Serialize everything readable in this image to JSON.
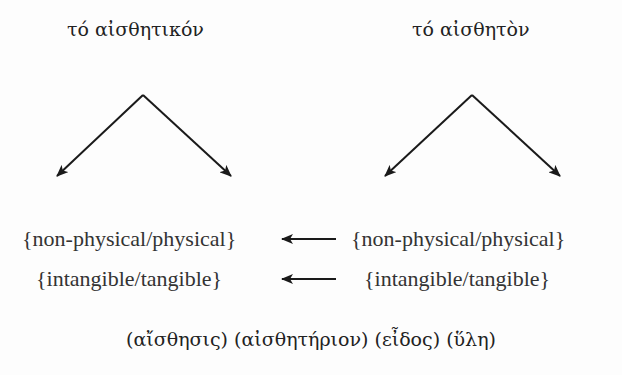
{
  "headings": {
    "left": "τό αἰσθητικόν",
    "right": "τό αἰσθητὸν"
  },
  "rows": [
    {
      "left": "{non-physical/physical}",
      "right": "{non-physical/physical}",
      "arrow": "left"
    },
    {
      "left": "{intangible/tangible}",
      "right": "{intangible/tangible}",
      "arrow": "left"
    }
  ],
  "bottom_terms": "(αἴσθησις) (αἰσθητήριον) (εἶδος) (ὕλη)",
  "colors": {
    "line": "#1a1a1a",
    "text": "#222222",
    "background": "#fdfdfd"
  }
}
